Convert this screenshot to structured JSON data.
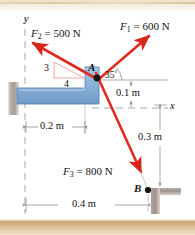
{
  "figure": {
    "colors": {
      "force_arrow": "#e02b20",
      "force_arrow_dark": "#c3201a",
      "member_blue": "#8fb4d9",
      "member_blue_edge": "#4a76a8",
      "support_gray": "#b0a8a4",
      "axis_gray": "#a8a8a8",
      "slope_tri": "#e8a9a0",
      "dot_black": "#111111",
      "page_strip": "#e0c79f"
    }
  },
  "axes": {
    "y_label": "y",
    "x_label": "x"
  },
  "points": {
    "a_label": "A",
    "b_label": "B"
  },
  "forces": [
    {
      "name": "F1",
      "label_main": "F",
      "label_sub": "1",
      "label_value": " = 600 N",
      "magnitude": 600,
      "unit": "N",
      "direction": "up-right",
      "angle_label": "35",
      "angle_unit": "°"
    },
    {
      "name": "F2",
      "label_main": "F",
      "label_sub": "2",
      "label_value": " = 500 N",
      "magnitude": 500,
      "unit": "N",
      "direction": "up-left",
      "slope_vertical": "3",
      "slope_horizontal": "4"
    },
    {
      "name": "F3",
      "label_main": "F",
      "label_sub": "3",
      "label_value": " = 800 N",
      "magnitude": 800,
      "unit": "N",
      "direction": "down-right"
    }
  ],
  "dimensions": [
    {
      "name": "dim-0-1",
      "label": "0.1 m",
      "value": 0.1,
      "unit": "m",
      "orientation": "vertical"
    },
    {
      "name": "dim-0-2",
      "label": "0.2 m",
      "value": 0.2,
      "unit": "m",
      "orientation": "horizontal"
    },
    {
      "name": "dim-0-3",
      "label": "0.3 m",
      "value": 0.3,
      "unit": "m",
      "orientation": "vertical"
    },
    {
      "name": "dim-0-4",
      "label": "0.4 m",
      "value": 0.4,
      "unit": "m",
      "orientation": "horizontal"
    }
  ]
}
